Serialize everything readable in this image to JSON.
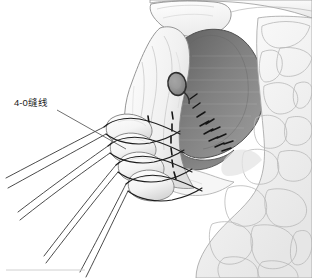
{
  "figure": {
    "type": "medical-surgical-illustration",
    "title": "",
    "background_color": "#ffffff",
    "width": 312,
    "height": 278
  },
  "annotations": [
    {
      "id": "suture-label",
      "text": "4-0缝线",
      "x": 14,
      "y": 106,
      "leader_from": [
        57,
        110
      ],
      "leader_to": [
        126,
        149
      ]
    }
  ],
  "structures": {
    "cavity": {
      "name": "resection-cavity",
      "fill_dark": "#6e6e6e",
      "fill_mid": "#8a8a8a",
      "fill_light": "#a8a8a8",
      "stroke": "#4a4a4a"
    },
    "fat_tissue": {
      "name": "lobulated-fat-tissue",
      "fill": "#fbfbfb",
      "shade": "#ededed",
      "stroke": "#9a9a9a"
    },
    "upper_organ": {
      "name": "upper-organ-edge",
      "fill": "#fafafa",
      "stroke": "#8f8f8f"
    },
    "flap": {
      "name": "tissue-flap",
      "fill": "#f7f7f7",
      "stroke": "#8a8a8a"
    },
    "duct_stump": {
      "name": "duct-stump",
      "fill": "#8f8f8f",
      "stroke": "#2e2e2e",
      "cx": 177,
      "cy": 84,
      "rx": 9,
      "ry": 11
    },
    "rolled_edge": {
      "name": "rolled-tissue-edge",
      "fill": "#fcfcfc",
      "stroke": "#7d7d7d"
    }
  },
  "sutures": {
    "color": "#1e1e1e",
    "count_loops": 4,
    "count_strands": 8,
    "dashed_line_color": "#151515",
    "loops": [
      {
        "id": "loop-1",
        "cy": 128
      },
      {
        "id": "loop-2",
        "cy": 146
      },
      {
        "id": "loop-3",
        "cy": 165
      },
      {
        "id": "loop-4",
        "cy": 184
      }
    ]
  },
  "caption_rule": {
    "name": "caption-rule",
    "color": "#d0d0d0",
    "x1": 6,
    "x2": 85,
    "y": 270
  }
}
